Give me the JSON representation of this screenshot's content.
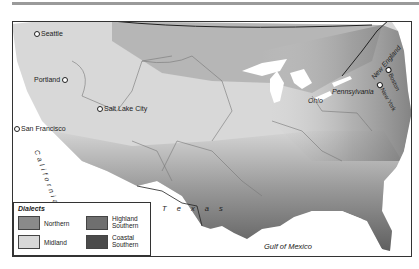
{
  "map": {
    "title": "Dialects",
    "cities": [
      {
        "name": "Seattle"
      },
      {
        "name": "Portland"
      },
      {
        "name": "Salt Lake City"
      },
      {
        "name": "San Francisco"
      },
      {
        "name": "Boston"
      },
      {
        "name": "New York"
      }
    ],
    "regions": {
      "california": "California",
      "texas": "T e x a s",
      "ohio": "Ohio",
      "pennsylvania": "Pennsylvania",
      "new_england": "New England",
      "gulf": "Gulf of Mexico"
    },
    "legend": {
      "title": "Dialects",
      "items": [
        {
          "label": "Northern",
          "color": "#8a8a8a"
        },
        {
          "label": "Midland",
          "color": "#d8d8d8"
        },
        {
          "label": "Highland Southern",
          "line1": "Highland",
          "line2": "Southern",
          "color": "#6f6f6f"
        },
        {
          "label": "Coastal Southern",
          "line1": "Coastal",
          "line2": "Southern",
          "color": "#4a4a4a"
        }
      ]
    },
    "colors": {
      "northern": "#8a8a8a",
      "midland": "#d8d8d8",
      "highland_southern": "#6f6f6f",
      "coastal_southern": "#4a4a4a",
      "water": "#ffffff",
      "border": "#222222"
    }
  }
}
